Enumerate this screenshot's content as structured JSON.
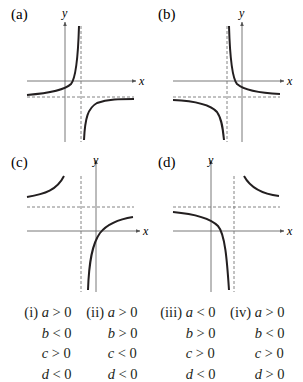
{
  "panels": [
    {
      "id": "a",
      "label": "(a)",
      "x_label": "x",
      "y_label": "y",
      "vertical_asymptote_side": "right-of-y-axis",
      "horizontal_asymptote_side": "below-x-axis",
      "branches": "upper-left / lower-right"
    },
    {
      "id": "b",
      "label": "(b)",
      "x_label": "x",
      "y_label": "y",
      "vertical_asymptote_side": "left-of-y-axis",
      "horizontal_asymptote_side": "below-x-axis",
      "branches": "upper-right / lower-left"
    },
    {
      "id": "c",
      "label": "(c)",
      "x_label": "x",
      "y_label": "y",
      "vertical_asymptote_side": "left-of-y-axis",
      "horizontal_asymptote_side": "above-x-axis",
      "branches": "upper-left / lower-right"
    },
    {
      "id": "d",
      "label": "(d)",
      "x_label": "x",
      "y_label": "y",
      "vertical_asymptote_side": "right-of-y-axis",
      "horizontal_asymptote_side": "above-x-axis",
      "branches": "upper-right / lower-left"
    }
  ],
  "conditions": [
    {
      "label": "(i)",
      "rows": [
        [
          "a",
          ">",
          "0"
        ],
        [
          "b",
          "<",
          "0"
        ],
        [
          "c",
          ">",
          "0"
        ],
        [
          "d",
          "<",
          "0"
        ]
      ]
    },
    {
      "label": "(ii)",
      "rows": [
        [
          "a",
          ">",
          "0"
        ],
        [
          "b",
          ">",
          "0"
        ],
        [
          "c",
          "<",
          "0"
        ],
        [
          "d",
          "<",
          "0"
        ]
      ]
    },
    {
      "label": "(iii)",
      "rows": [
        [
          "a",
          "<",
          "0"
        ],
        [
          "b",
          ">",
          "0"
        ],
        [
          "c",
          ">",
          "0"
        ],
        [
          "d",
          "<",
          "0"
        ]
      ]
    },
    {
      "label": "(iv)",
      "rows": [
        [
          "a",
          ">",
          "0"
        ],
        [
          "b",
          "<",
          "0"
        ],
        [
          "c",
          ">",
          "0"
        ],
        [
          "d",
          ">",
          "0"
        ]
      ]
    }
  ],
  "colors": {
    "ink": "#231f20",
    "axis": "#555555",
    "asymptote": "#777777"
  }
}
